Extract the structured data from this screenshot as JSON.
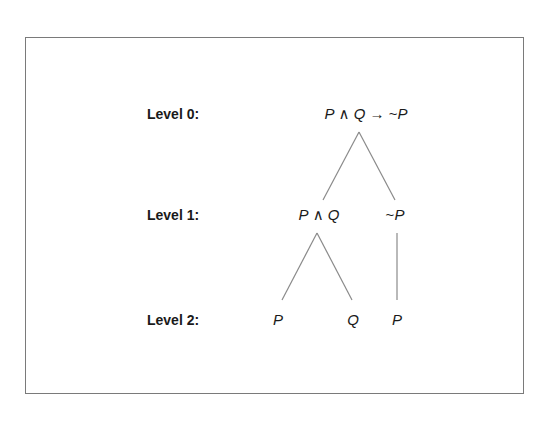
{
  "diagram": {
    "type": "parse-tree",
    "levels": [
      {
        "label": "Level 0:",
        "y": 106
      },
      {
        "label": "Level 1:",
        "y": 207
      },
      {
        "label": "Level 2:",
        "y": 312
      }
    ],
    "nodes": [
      {
        "id": "root",
        "level": 0,
        "x": 366,
        "parts": [
          "P",
          " ∧ ",
          "Q",
          " → ~",
          "P"
        ],
        "italic": [
          true,
          false,
          true,
          false,
          true
        ],
        "text": "P ∧ Q → ~P"
      },
      {
        "id": "conj",
        "level": 1,
        "x": 319,
        "parts": [
          "P",
          " ∧ ",
          "Q"
        ],
        "italic": [
          true,
          false,
          true
        ],
        "text": "P ∧ Q"
      },
      {
        "id": "neg",
        "level": 1,
        "x": 395,
        "parts": [
          "~",
          "P"
        ],
        "italic": [
          false,
          true
        ],
        "text": "~P"
      },
      {
        "id": "p1",
        "level": 2,
        "x": 278,
        "parts": [
          "P"
        ],
        "italic": [
          true
        ],
        "text": "P"
      },
      {
        "id": "q1",
        "level": 2,
        "x": 353,
        "parts": [
          "Q"
        ],
        "italic": [
          true
        ],
        "text": "Q"
      },
      {
        "id": "p2",
        "level": 2,
        "x": 397,
        "parts": [
          "P"
        ],
        "italic": [
          true
        ],
        "text": "P"
      }
    ],
    "edges": [
      {
        "from": "root",
        "to": "conj",
        "x1": 359,
        "y1": 132,
        "x2": 323,
        "y2": 200
      },
      {
        "from": "root",
        "to": "neg",
        "x1": 359,
        "y1": 132,
        "x2": 395,
        "y2": 200
      },
      {
        "from": "conj",
        "to": "p1",
        "x1": 317,
        "y1": 233,
        "x2": 282,
        "y2": 300
      },
      {
        "from": "conj",
        "to": "q1",
        "x1": 317,
        "y1": 233,
        "x2": 352,
        "y2": 300
      },
      {
        "from": "neg",
        "to": "p2",
        "x1": 397,
        "y1": 233,
        "x2": 397,
        "y2": 300
      }
    ],
    "colors": {
      "text": "#1a1a1a",
      "lines": "#8a8a8a",
      "frame": "#7a7a7a",
      "background": "#ffffff"
    }
  }
}
